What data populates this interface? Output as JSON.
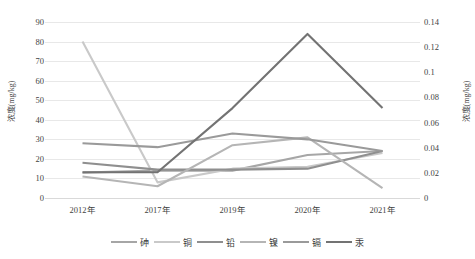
{
  "chart_data": {
    "type": "line",
    "title": "",
    "xlabel": "",
    "ylabel": "浓度(mg/kg)",
    "y2label": "浓度(mg/kg)",
    "categories": [
      "2012年",
      "2017年",
      "2019年",
      "2020年",
      "2021年"
    ],
    "ylim": [
      0,
      90
    ],
    "ytick_step": 10,
    "yticks": [
      "90",
      "80",
      "70",
      "60",
      "50",
      "40",
      "30",
      "20",
      "10",
      "0"
    ],
    "y2lim": [
      0,
      0.14
    ],
    "y2tick_step": 0.02,
    "y2ticks": [
      "0.14",
      "0.12",
      "0.1",
      "0.08",
      "0.06",
      "0.04",
      "0.02",
      "0"
    ],
    "grid": true,
    "legend_position": "bottom",
    "series": [
      {
        "name": "砷",
        "axis": "left",
        "color": "#a6a6a6",
        "values": [
          13,
          14,
          14,
          22,
          24
        ]
      },
      {
        "name": "铜",
        "axis": "left",
        "color": "#c9c9c9",
        "values": [
          80,
          8,
          15,
          16,
          23
        ]
      },
      {
        "name": "铅",
        "axis": "left",
        "color": "#8f8f8f",
        "values": [
          18,
          14.5,
          14.5,
          15,
          24
        ]
      },
      {
        "name": "镍",
        "axis": "left",
        "color": "#b5b5b5",
        "values": [
          11,
          6,
          27,
          31,
          5
        ]
      },
      {
        "name": "镉",
        "axis": "left",
        "color": "#9a9a9a",
        "values": [
          28,
          26,
          33,
          30,
          24
        ]
      },
      {
        "name": "汞",
        "axis": "right",
        "color": "#737373",
        "values": [
          0.0205,
          0.0205,
          0.0715,
          0.1305,
          0.0715
        ]
      }
    ]
  },
  "axes": {
    "left_title": "浓度(mg/kg)",
    "right_title": "浓度(mg/kg)"
  }
}
